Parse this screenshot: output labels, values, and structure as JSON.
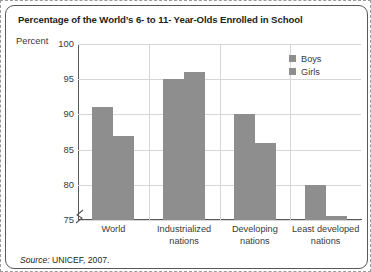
{
  "title": "Percentage of the World’s 6- to 11- Year-Olds Enrolled in School",
  "axis": {
    "y_label": "Percent",
    "ticks": [
      "100",
      "95",
      "90",
      "85",
      "80",
      "75"
    ]
  },
  "legend": {
    "items": [
      {
        "label": "Boys",
        "color": "#8e8e8e"
      },
      {
        "label": "Girls",
        "color": "#8e8e8e"
      }
    ]
  },
  "categories": [
    {
      "line1": "World",
      "line2": ""
    },
    {
      "line1": "Industrialized",
      "line2": "nations"
    },
    {
      "line1": "Developing",
      "line2": "nations"
    },
    {
      "line1": "Least developed",
      "line2": "nations"
    }
  ],
  "source": {
    "prefix": "Source:",
    "text": " UNICEF, 2007."
  },
  "chart_data": {
    "type": "bar",
    "title": "Percentage of the World’s 6- to 11- Year-Olds Enrolled in School",
    "xlabel": "",
    "ylabel": "Percent",
    "ylim": [
      75,
      100
    ],
    "yticks": [
      75,
      80,
      85,
      90,
      95,
      100
    ],
    "grid": true,
    "legend_position": "top-right",
    "categories": [
      "World",
      "Industrialized nations",
      "Developing nations",
      "Least developed nations"
    ],
    "series": [
      {
        "name": "Boys",
        "values": [
          91,
          95,
          90,
          80
        ],
        "color": "#8e8e8e"
      },
      {
        "name": "Girls",
        "values": [
          87,
          96,
          86,
          75.5
        ],
        "color": "#8e8e8e"
      }
    ],
    "annotations": [
      "y-axis is broken below 75"
    ],
    "source": "Source: UNICEF, 2007."
  }
}
